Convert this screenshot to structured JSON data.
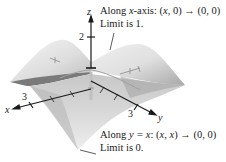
{
  "figure": {
    "type": "3d-surface-plot",
    "axes": {
      "x_label": "x",
      "y_label": "y",
      "z_label": "z",
      "z_tick": "2",
      "x_tick": "3",
      "y_tick": "3"
    },
    "annotations": [
      {
        "id": "x-axis-path",
        "line1_prefix": "Along ",
        "line1_var": "x",
        "line1_suffix": "-axis:  (",
        "line1_expr_var": "x",
        "line1_expr_rest": ", 0) → (0, 0)",
        "line2": "Limit is 1."
      },
      {
        "id": "diagonal-path",
        "line1_prefix": "Along ",
        "line1_var": "y = x",
        "line1_suffix": ":  (",
        "line1_expr_var": "x, x",
        "line1_expr_rest": ") → (0, 0)",
        "line2": "Limit is 0."
      }
    ],
    "colors": {
      "surface_light": "#f2f2f2",
      "surface_mid": "#d0d0d0",
      "surface_dark": "#9a9a9a",
      "axis": "#1a1a1a"
    }
  }
}
